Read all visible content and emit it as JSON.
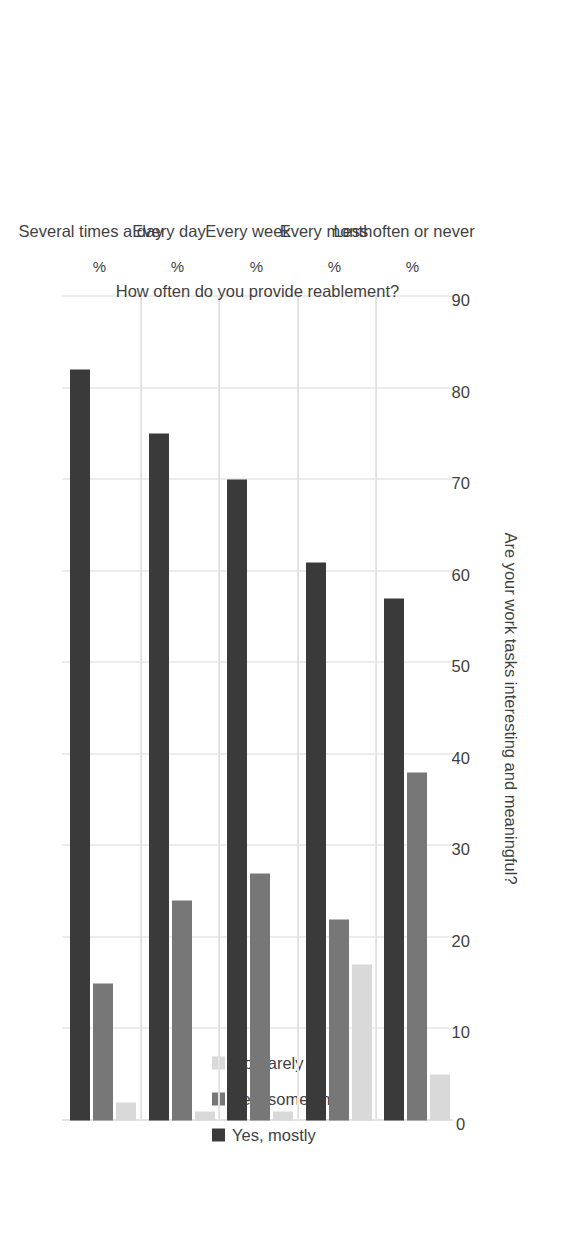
{
  "chart_data": {
    "type": "bar",
    "orientation": "vertical-grouped-rotated",
    "title": "",
    "xlabel": "How often do you provide reablement?",
    "ylabel": "Are your work tasks interesting and meaningful?",
    "categories": [
      "Several times a day",
      "Every day",
      "Every week",
      "Every month",
      "Less often or never"
    ],
    "category_unit_labels": [
      "%",
      "%",
      "%",
      "%",
      "%"
    ],
    "series": [
      {
        "name": "Yes, mostly",
        "color": "#3a3a3a",
        "values": [
          82,
          75,
          70,
          61,
          57
        ]
      },
      {
        "name": "Yes, sometimes",
        "color": "#777777",
        "values": [
          15,
          24,
          27,
          22,
          38
        ]
      },
      {
        "name": "No, rarely",
        "color": "#d9d9d9",
        "values": [
          2,
          1,
          1,
          17,
          5
        ]
      }
    ],
    "ylim": [
      0,
      90
    ],
    "yticks": [
      90,
      80,
      70,
      60,
      50,
      40,
      30,
      20,
      10,
      0
    ],
    "ytick_labels": [
      "90",
      "80",
      "70",
      "60",
      "50",
      "40",
      "30",
      "20",
      "10",
      "0"
    ],
    "grid": true,
    "legend_position": "top",
    "legend_entries": [
      "Yes, mostly",
      "Yes, sometimes",
      "No, rarely"
    ]
  }
}
